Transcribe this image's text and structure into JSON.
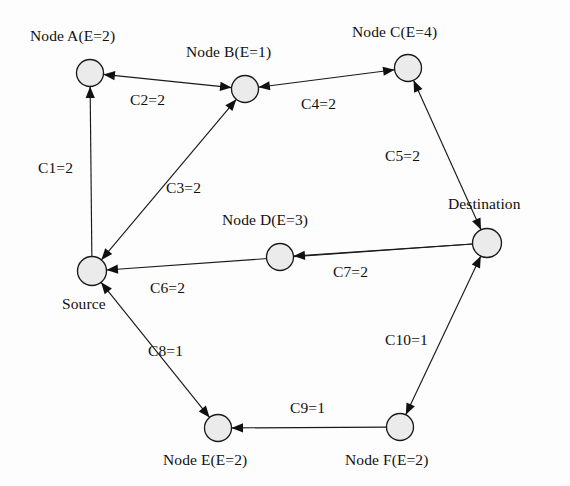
{
  "diagram": {
    "type": "directed-graph",
    "colors": {
      "node_fill": "#ebebeb",
      "node_stroke": "#1a1a1a",
      "edge": "#1a1a1a",
      "text": "#101010",
      "background": "#fdfdfd"
    },
    "nodes": [
      {
        "id": "A",
        "label": "Node A(E=2)",
        "energy": 2,
        "x": 90,
        "y": 73,
        "r": 13.5,
        "label_x": 30,
        "label_y": 28
      },
      {
        "id": "B",
        "label": "Node B(E=1)",
        "energy": 1,
        "x": 245,
        "y": 89,
        "r": 13.5,
        "label_x": 186,
        "label_y": 44
      },
      {
        "id": "C",
        "label": "Node C(E=4)",
        "energy": 4,
        "x": 408,
        "y": 68,
        "r": 13.5,
        "label_x": 352,
        "label_y": 24
      },
      {
        "id": "D",
        "label": "Node D(E=3)",
        "energy": 3,
        "x": 280,
        "y": 257,
        "r": 13.5,
        "label_x": 222,
        "label_y": 212
      },
      {
        "id": "Source",
        "label": "Source",
        "energy": null,
        "x": 92,
        "y": 271,
        "r": 14.5,
        "label_x": 62,
        "label_y": 296
      },
      {
        "id": "Destination",
        "label": "Destination",
        "energy": null,
        "x": 487,
        "y": 243,
        "r": 14.5,
        "label_x": 448,
        "label_y": 196
      },
      {
        "id": "E",
        "label": "Node E(E=2)",
        "energy": 2,
        "x": 218,
        "y": 428,
        "r": 13.5,
        "label_x": 163,
        "label_y": 452
      },
      {
        "id": "F",
        "label": "Node F(E=2)",
        "energy": 2,
        "x": 400,
        "y": 427,
        "r": 13.5,
        "label_x": 345,
        "label_y": 452
      }
    ],
    "edges": [
      {
        "id": "C1",
        "label": "C1=2",
        "cost": 2,
        "from": "Source",
        "to": "A",
        "arrow_at_from": false,
        "label_x": 38,
        "label_y": 160
      },
      {
        "id": "C2",
        "label": "C2=2",
        "cost": 2,
        "from": "B",
        "to": "A",
        "arrow_at_from": true,
        "label_x": 130,
        "label_y": 92
      },
      {
        "id": "C3",
        "label": "C3=2",
        "cost": 2,
        "from": "Source",
        "to": "B",
        "arrow_at_from": true,
        "label_x": 166,
        "label_y": 180
      },
      {
        "id": "C4",
        "label": "C4=2",
        "cost": 2,
        "from": "C",
        "to": "B",
        "arrow_at_from": true,
        "label_x": 301,
        "label_y": 96
      },
      {
        "id": "C5",
        "label": "C5=2",
        "cost": 2,
        "from": "Destination",
        "to": "C",
        "arrow_at_from": true,
        "label_x": 385,
        "label_y": 148
      },
      {
        "id": "C6",
        "label": "C6=2",
        "cost": 2,
        "from": "Destination",
        "to": "Source",
        "arrow_at_from": false,
        "label_x": 150,
        "label_y": 280
      },
      {
        "id": "C7",
        "label": "C7=2",
        "cost": 2,
        "from": "Destination",
        "to": "D",
        "arrow_at_from": false,
        "label_x": 333,
        "label_y": 264
      },
      {
        "id": "C8",
        "label": "C8=1",
        "cost": 1,
        "from": "Source",
        "to": "E",
        "arrow_at_from": true,
        "label_x": 148,
        "label_y": 343
      },
      {
        "id": "C9",
        "label": "C9=1",
        "cost": 1,
        "from": "F",
        "to": "E",
        "arrow_at_from": false,
        "label_x": 290,
        "label_y": 400
      },
      {
        "id": "C10",
        "label": "C10=1",
        "cost": 1,
        "from": "F",
        "to": "Destination",
        "arrow_at_from": true,
        "label_x": 385,
        "label_y": 332
      }
    ]
  }
}
